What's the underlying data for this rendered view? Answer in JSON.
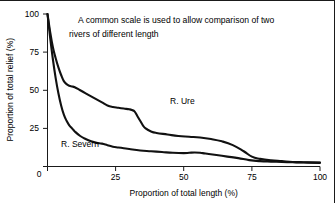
{
  "chart_data": {
    "type": "line",
    "title": "",
    "annotation": "A common scale is used to allow comparison of two rivers of different length",
    "annotation_line1": "A common scale is used to allow comparison of two",
    "annotation_line2": "rivers of different length",
    "xlabel": "Proportion of total length (%)",
    "ylabel": "Proportion of total relief (%)",
    "xlim": [
      0,
      100
    ],
    "ylim": [
      0,
      100
    ],
    "xticks": [
      0,
      25,
      50,
      75,
      100
    ],
    "yticks": [
      0,
      25,
      50,
      75,
      100
    ],
    "xtick_labels": [
      "0",
      "25",
      "50",
      "75",
      "100"
    ],
    "ytick_labels": [
      "0",
      "25",
      "50",
      "75",
      "100"
    ],
    "grid": false,
    "legend": "inline-labels",
    "line_color": "#111111",
    "series": [
      {
        "name": "R. Ure",
        "label": "R. Ure",
        "label_x": 45,
        "label_y": 41,
        "x": [
          0,
          1,
          2,
          3,
          4,
          5,
          6,
          7,
          8,
          9,
          10,
          12,
          14,
          16,
          18,
          20,
          22,
          24,
          26,
          28,
          30,
          31,
          32,
          33,
          34,
          35,
          36,
          38,
          40,
          44,
          48,
          52,
          56,
          60,
          64,
          68,
          72,
          75,
          78,
          82,
          86,
          90,
          94,
          100
        ],
        "y": [
          100,
          88,
          78,
          71,
          65,
          60,
          56,
          54,
          53,
          52.5,
          52,
          50,
          48,
          46,
          44,
          42,
          40,
          39,
          38.5,
          38,
          37.5,
          37,
          36,
          33,
          30,
          27,
          25,
          23,
          22,
          21,
          20,
          19.5,
          19,
          18,
          16.5,
          14,
          10,
          6.5,
          5,
          4,
          3.5,
          3,
          2.8,
          2.6
        ]
      },
      {
        "name": "R. Severn",
        "label": "R. Severn",
        "label_x": 5,
        "label_y": 13,
        "x": [
          0,
          1,
          2,
          3,
          4,
          5,
          6,
          7,
          8,
          9,
          10,
          12,
          14,
          16,
          18,
          20,
          22,
          24,
          26,
          28,
          30,
          34,
          38,
          42,
          46,
          50,
          52,
          54,
          56,
          58,
          62,
          66,
          70,
          74,
          78,
          82,
          86,
          90,
          94,
          100
        ],
        "y": [
          100,
          84,
          70,
          58,
          48,
          40,
          34,
          30,
          27,
          25,
          23,
          20,
          18,
          16.5,
          15.5,
          15,
          14,
          13,
          12.5,
          12,
          11.5,
          10.5,
          10,
          9.5,
          9,
          8.8,
          9,
          9.2,
          9,
          8.5,
          7.5,
          6.5,
          5.5,
          4.2,
          3.5,
          3.2,
          3,
          2.8,
          2.6,
          2.4
        ]
      }
    ]
  }
}
